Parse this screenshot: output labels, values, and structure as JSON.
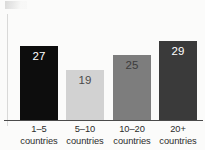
{
  "chart_data": {
    "type": "bar",
    "title": "",
    "subtitle": "",
    "xlabel": "",
    "ylabel": "",
    "grid": false,
    "legend": false,
    "ylim": [
      0,
      33
    ],
    "categories": [
      "1–5 countries",
      "5–10 countries",
      "10–20 countries",
      "20+ countries"
    ],
    "category_lines": [
      {
        "line1": "1–5",
        "line2": "countries"
      },
      {
        "line1": "5–10",
        "line2": "countries"
      },
      {
        "line1": "10–20",
        "line2": "countries"
      },
      {
        "line1": "20+",
        "line2": "countries"
      }
    ],
    "values": [
      27,
      19,
      25,
      29
    ],
    "value_labels": [
      "27",
      "19",
      "25",
      "29"
    ],
    "bar_colors": [
      "#0d0d0d",
      "#d2d2d2",
      "#7d7d7d",
      "#3a3a3a"
    ],
    "value_label_colors": [
      "#ffffff",
      "#4a4a4a",
      "#3c3c3c",
      "#ffffff"
    ],
    "background_color": "#fbfbfa",
    "axis_color": "#4a4a4a"
  },
  "layout": {
    "bars": [
      {
        "left": 20,
        "width": 38,
        "height": 75
      },
      {
        "left": 66,
        "width": 38,
        "height": 51
      },
      {
        "left": 113,
        "width": 38,
        "height": 66
      },
      {
        "left": 159,
        "width": 38,
        "height": 80
      }
    ],
    "category_slots": [
      {
        "left": 8,
        "width": 62
      },
      {
        "left": 54,
        "width": 62
      },
      {
        "left": 101,
        "width": 62
      },
      {
        "left": 147,
        "width": 62
      }
    ]
  }
}
